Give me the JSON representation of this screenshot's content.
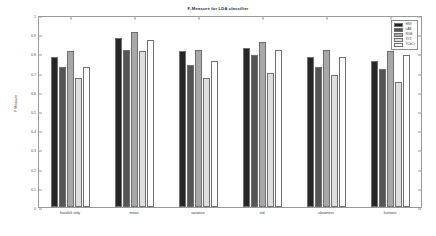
{
  "chart_data": {
    "type": "bar",
    "title": "F-Measure for LDA classifier",
    "xlabel": "",
    "ylabel": "F Measure",
    "ylim": [
      0,
      1
    ],
    "ytick_step": 0.1,
    "yticks": [
      "0",
      "0.1",
      "0.2",
      "0.3",
      "0.4",
      "0.5",
      "0.6",
      "0.7",
      "0.8",
      "0.9",
      "1"
    ],
    "grid": false,
    "legend_position": "upper right",
    "categories": [
      "haralick only",
      "mean",
      "variance",
      "std",
      "skewness",
      "kurtosis"
    ],
    "series": [
      {
        "name": "HSV",
        "color": "#262626",
        "values": [
          0.78,
          0.88,
          0.81,
          0.83,
          0.78,
          0.76
        ]
      },
      {
        "name": "LAB",
        "color": "#555555",
        "values": [
          0.73,
          0.82,
          0.74,
          0.79,
          0.73,
          0.72
        ]
      },
      {
        "name": "RGB",
        "color": "#a8a8a8",
        "values": [
          0.81,
          0.91,
          0.82,
          0.86,
          0.82,
          0.81
        ]
      },
      {
        "name": "XYZ",
        "color": "#dedede",
        "values": [
          0.67,
          0.81,
          0.67,
          0.7,
          0.69,
          0.65
        ]
      },
      {
        "name": "YCbCr",
        "color": "#ffffff",
        "values": [
          0.73,
          0.87,
          0.76,
          0.82,
          0.78,
          0.79
        ]
      }
    ]
  }
}
